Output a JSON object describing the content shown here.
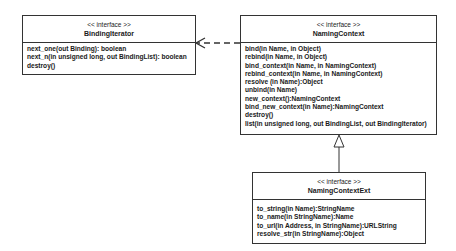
{
  "diagram": {
    "type": "uml-class",
    "classes": [
      {
        "id": "binding_iterator",
        "stereotype": "<< interface >>",
        "name": "BindingIterator",
        "operations": [
          "next_one(out Binding): boolean",
          "next_n(in unsigned long, out BindingList): boolean",
          "destroy()"
        ]
      },
      {
        "id": "naming_context",
        "stereotype": "<< interface >>",
        "name": "NamingContext",
        "operations": [
          "bind(in Name, in Object)",
          "rebind(in Name, in Object)",
          "bind_context(in Name, in NamingContext)",
          "rebind_context(in Name, in NamingContext)",
          "resolve (in Name):Object",
          "unbind(in Name)",
          "new_context():NamingContext",
          "bind_new_context(in Name):NamingContext",
          "destroy()",
          "list(in unsigned long, out BindingList, out BindingIterator)"
        ]
      },
      {
        "id": "naming_context_ext",
        "stereotype": "<< interface >>",
        "name": "NamingContextExt",
        "operations": [
          "to_string(in Name):StringName",
          "to_name(in StringName):Name",
          "to_url(in Address, in StringName):URLString",
          "resolve_str(in StringName):Object"
        ]
      }
    ],
    "relationships": [
      {
        "type": "dependency",
        "from": "NamingContext",
        "to": "BindingIterator",
        "style": "dashed-open-arrow"
      },
      {
        "type": "generalization",
        "from": "NamingContextExt",
        "to": "NamingContext",
        "style": "hollow-triangle"
      }
    ],
    "colors": {
      "line": "#333333",
      "background": "#ffffff",
      "text": "#1a1a1a"
    }
  }
}
